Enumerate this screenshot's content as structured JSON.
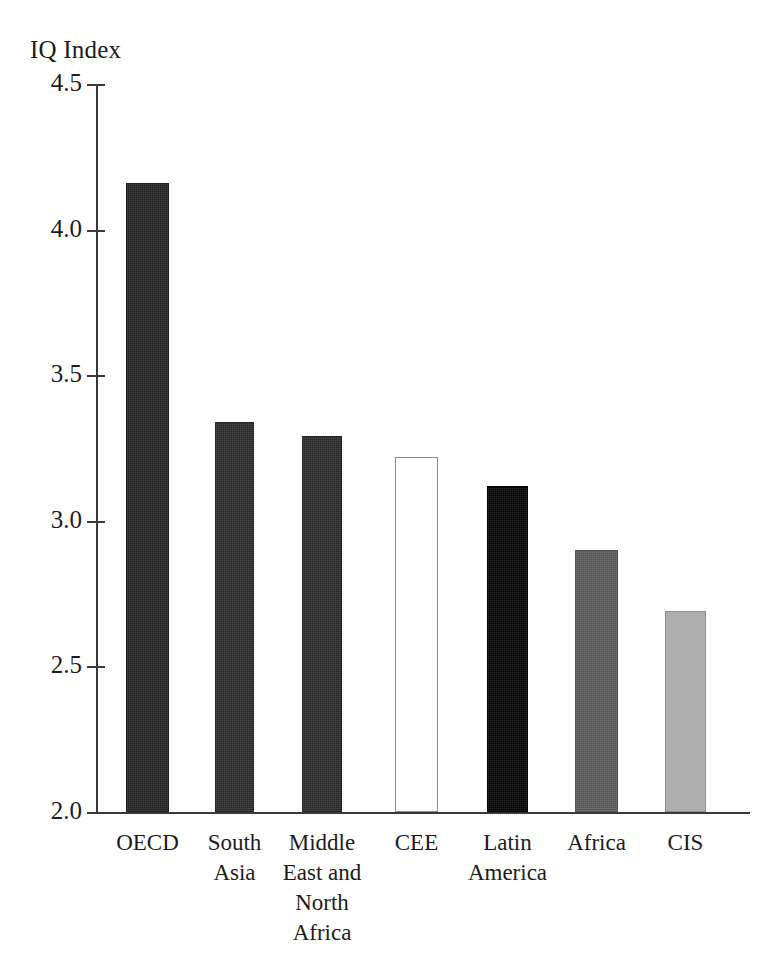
{
  "chart_data": {
    "type": "bar",
    "title": "IQ Index",
    "xlabel": "",
    "ylabel": "IQ Index",
    "ylim": [
      2.0,
      4.5
    ],
    "yticks": [
      "2.0",
      "2.5",
      "3.0",
      "3.5",
      "4.0",
      "4.5"
    ],
    "ytick_values": [
      2.0,
      2.5,
      3.0,
      3.5,
      4.0,
      4.5
    ],
    "grid": false,
    "legend": "none",
    "categories": [
      "OECD",
      "South Asia",
      "Middle East and North Africa",
      "CEE",
      "Latin America",
      "Africa",
      "CIS"
    ],
    "category_label_lines": [
      [
        "OECD"
      ],
      [
        "South",
        "Asia"
      ],
      [
        "Middle",
        "East and",
        "North",
        "Africa"
      ],
      [
        "CEE"
      ],
      [
        "Latin",
        "America"
      ],
      [
        "Africa"
      ],
      [
        "CIS"
      ]
    ],
    "values": [
      4.16,
      3.34,
      3.29,
      3.22,
      3.12,
      2.9,
      2.69
    ],
    "bar_colors": [
      "#1f1f1f",
      "#262626",
      "#262626",
      "#ffffff",
      "#000000",
      "#545454",
      "#a8a8a8"
    ],
    "bar_border_colors": [
      "#1f1f1f",
      "#262626",
      "#262626",
      "#8a8a8a",
      "#000000",
      "#545454",
      "#8d8d8d"
    ]
  },
  "axis": {
    "line_color": "#3a3a3a"
  }
}
